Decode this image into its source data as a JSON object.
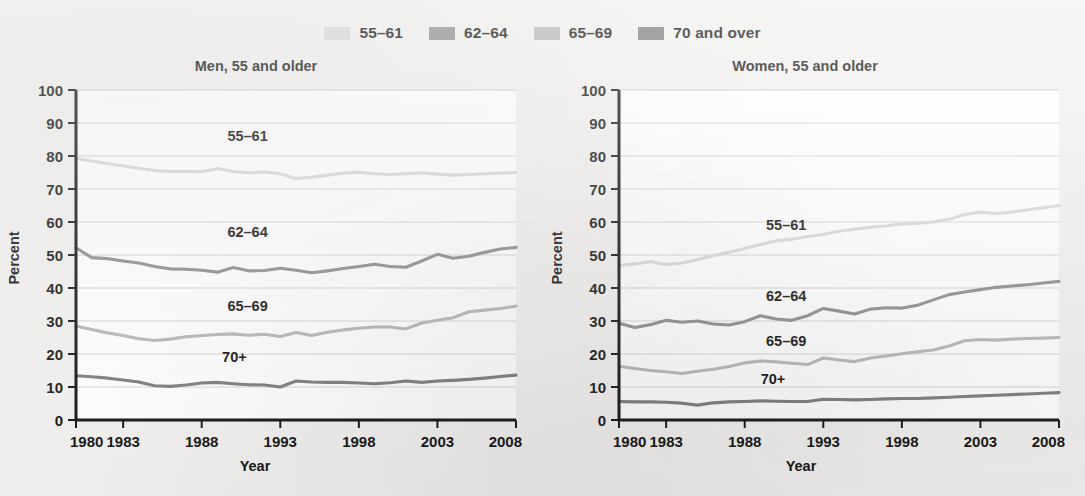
{
  "legend": {
    "entries": [
      {
        "label": "55–61",
        "color": "#d8d8d8",
        "key": "55-61"
      },
      {
        "label": "62–64",
        "color": "#8c8c8c",
        "key": "62-64"
      },
      {
        "label": "65–69",
        "color": "#b5b5b5",
        "key": "65-69"
      },
      {
        "label": "70 and over",
        "color": "#7a7a7a",
        "key": "70+"
      }
    ]
  },
  "chart_data": [
    {
      "type": "line",
      "title": "Men, 55 and older",
      "xlabel": "Year",
      "ylabel": "Percent",
      "ylim": [
        0,
        100
      ],
      "xlim": [
        1980,
        2008
      ],
      "yticks": [
        0,
        10,
        20,
        30,
        40,
        50,
        60,
        70,
        80,
        90,
        100
      ],
      "xticks": [
        1980,
        1983,
        1988,
        1993,
        1998,
        2003,
        2008
      ],
      "xtick_labels": [
        "1980",
        "1983",
        "1988",
        "1993",
        "1998",
        "2003",
        "2008"
      ],
      "grid": true,
      "legend_position": "top-center-shared",
      "x": [
        1980,
        1981,
        1982,
        1983,
        1984,
        1985,
        1986,
        1987,
        1988,
        1989,
        1990,
        1991,
        1992,
        1993,
        1994,
        1995,
        1996,
        1997,
        1998,
        1999,
        2000,
        2001,
        2002,
        2003,
        2004,
        2005,
        2006,
        2007,
        2008
      ],
      "series": [
        {
          "name": "55–61",
          "color": "#d8d8d8",
          "annotation": "55–61",
          "values": [
            79.3,
            78.5,
            77.7,
            77.0,
            76.3,
            75.6,
            75.3,
            75.4,
            75.2,
            76.2,
            75.3,
            74.9,
            75.2,
            74.6,
            73.2,
            73.6,
            74.2,
            74.8,
            75.1,
            74.6,
            74.4,
            74.6,
            74.9,
            74.5,
            74.2,
            74.4,
            74.6,
            74.8,
            75.0
          ]
        },
        {
          "name": "62–64",
          "color": "#8c8c8c",
          "annotation": "62–64",
          "values": [
            52.2,
            49.2,
            48.9,
            48.2,
            47.6,
            46.5,
            45.8,
            45.7,
            45.4,
            44.8,
            46.2,
            45.2,
            45.3,
            46.0,
            45.4,
            44.6,
            45.2,
            45.9,
            46.5,
            47.2,
            46.5,
            46.3,
            48.2,
            50.2,
            49.0,
            49.6,
            50.8,
            51.8,
            52.3
          ]
        },
        {
          "name": "65–69",
          "color": "#b5b5b5",
          "annotation": "65–69",
          "values": [
            28.5,
            27.4,
            26.4,
            25.6,
            24.6,
            24.1,
            24.5,
            25.2,
            25.6,
            25.9,
            26.1,
            25.7,
            26.0,
            25.3,
            26.5,
            25.6,
            26.6,
            27.3,
            27.8,
            28.2,
            28.2,
            27.6,
            29.4,
            30.2,
            31.0,
            32.8,
            33.3,
            33.8,
            34.5
          ]
        },
        {
          "name": "70+",
          "color": "#7a7a7a",
          "annotation": "70+",
          "values": [
            13.4,
            13.1,
            12.7,
            12.1,
            11.5,
            10.4,
            10.2,
            10.6,
            11.2,
            11.4,
            11.0,
            10.7,
            10.6,
            10.0,
            11.8,
            11.5,
            11.4,
            11.4,
            11.2,
            11.0,
            11.3,
            11.8,
            11.4,
            11.8,
            12.0,
            12.3,
            12.7,
            13.2,
            13.6
          ]
        }
      ]
    },
    {
      "type": "line",
      "title": "Women, 55 and older",
      "xlabel": "Year",
      "ylabel": "Percent",
      "ylim": [
        0,
        100
      ],
      "xlim": [
        1980,
        2008
      ],
      "yticks": [
        0,
        10,
        20,
        30,
        40,
        50,
        60,
        70,
        80,
        90,
        100
      ],
      "xticks": [
        1980,
        1983,
        1988,
        1993,
        1998,
        2003,
        2008
      ],
      "xtick_labels": [
        "1980",
        "1983",
        "1988",
        "1993",
        "1998",
        "2003",
        "2008"
      ],
      "grid": true,
      "legend_position": "top-center-shared",
      "x": [
        1980,
        1981,
        1982,
        1983,
        1984,
        1985,
        1986,
        1987,
        1988,
        1989,
        1990,
        1991,
        1992,
        1993,
        1994,
        1995,
        1996,
        1997,
        1998,
        1999,
        2000,
        2001,
        2002,
        2003,
        2004,
        2005,
        2006,
        2007,
        2008
      ],
      "series": [
        {
          "name": "55–61",
          "color": "#d8d8d8",
          "annotation": "55–61",
          "values": [
            46.8,
            47.3,
            48.0,
            47.1,
            47.6,
            48.6,
            49.8,
            50.8,
            52.0,
            53.2,
            54.3,
            54.8,
            55.6,
            56.2,
            57.2,
            57.8,
            58.4,
            58.8,
            59.4,
            59.6,
            60.0,
            60.8,
            62.3,
            63.0,
            62.6,
            63.0,
            63.7,
            64.3,
            65.0
          ]
        },
        {
          "name": "62–64",
          "color": "#8c8c8c",
          "annotation": "62–64",
          "values": [
            29.3,
            28.0,
            28.9,
            30.2,
            29.6,
            30.0,
            29.1,
            28.8,
            29.8,
            31.6,
            30.6,
            30.2,
            31.6,
            33.8,
            33.0,
            32.1,
            33.6,
            34.0,
            33.9,
            34.8,
            36.4,
            38.0,
            38.8,
            39.5,
            40.2,
            40.6,
            41.0,
            41.5,
            42.0
          ]
        },
        {
          "name": "65–69",
          "color": "#b5b5b5",
          "annotation": "65–69",
          "values": [
            16.3,
            15.6,
            15.0,
            14.6,
            14.1,
            14.8,
            15.4,
            16.2,
            17.3,
            17.9,
            17.6,
            17.2,
            16.8,
            18.8,
            18.2,
            17.7,
            18.8,
            19.4,
            20.1,
            20.7,
            21.2,
            22.4,
            24.0,
            24.4,
            24.2,
            24.5,
            24.7,
            24.8,
            25.0
          ]
        },
        {
          "name": "70+",
          "color": "#7a7a7a",
          "annotation": "70+",
          "values": [
            5.6,
            5.5,
            5.5,
            5.4,
            5.1,
            4.5,
            5.2,
            5.5,
            5.6,
            5.8,
            5.7,
            5.6,
            5.6,
            6.3,
            6.2,
            6.1,
            6.2,
            6.4,
            6.5,
            6.5,
            6.7,
            6.9,
            7.1,
            7.3,
            7.5,
            7.7,
            7.9,
            8.1,
            8.3
          ]
        }
      ]
    }
  ]
}
